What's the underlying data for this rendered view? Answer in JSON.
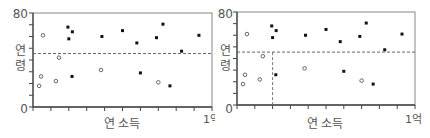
{
  "chart_data": [
    {
      "type": "scatter",
      "title": "",
      "xlabel": "연 소득",
      "ylabel": "연령",
      "x_tick_labels": {
        "start": "0",
        "end": "1억"
      },
      "y_tick_labels": {
        "top": "80",
        "bottom": "0"
      },
      "xlim": [
        0,
        100
      ],
      "ylim": [
        0,
        80
      ],
      "grid": false,
      "reference_lines": [
        {
          "orientation": "horizontal",
          "value": 45.5,
          "style": "dashed"
        }
      ],
      "series": [
        {
          "name": "open",
          "marker": "open-circle",
          "points": [
            [
              5.6,
              61
            ],
            [
              4.5,
              26
            ],
            [
              3.4,
              18
            ],
            [
              14.5,
              42
            ],
            [
              12.8,
              22
            ],
            [
              38,
              31.5
            ],
            [
              70,
              21
            ]
          ]
        },
        {
          "name": "filled",
          "marker": "filled-square",
          "points": [
            [
              20,
              58
            ],
            [
              19.5,
              68
            ],
            [
              22,
              64
            ],
            [
              21.8,
              26
            ],
            [
              38.5,
              60
            ],
            [
              50,
              65
            ],
            [
              58,
              54.5
            ],
            [
              60,
              29
            ],
            [
              69,
              59
            ],
            [
              72.6,
              70.5
            ],
            [
              76.5,
              18
            ],
            [
              83,
              47.5
            ],
            [
              92.7,
              61
            ]
          ]
        }
      ]
    },
    {
      "type": "scatter",
      "title": "",
      "xlabel": "연 소득",
      "ylabel": "연령",
      "x_tick_labels": {
        "start": "0",
        "end": "1억"
      },
      "y_tick_labels": {
        "top": "80",
        "bottom": "0"
      },
      "xlim": [
        0,
        100
      ],
      "ylim": [
        0,
        80
      ],
      "grid": false,
      "reference_lines": [
        {
          "orientation": "horizontal",
          "value": 45.5,
          "style": "dashed"
        },
        {
          "orientation": "vertical",
          "value": 20,
          "style": "dashed",
          "from": 0,
          "to": 45.5
        }
      ],
      "series": [
        {
          "name": "open",
          "marker": "open-circle",
          "points": [
            [
              5.6,
              61
            ],
            [
              4.5,
              26
            ],
            [
              3.4,
              18
            ],
            [
              14.5,
              42
            ],
            [
              12.8,
              22
            ],
            [
              38,
              31.5
            ],
            [
              70,
              21
            ]
          ]
        },
        {
          "name": "filled",
          "marker": "filled-square",
          "points": [
            [
              20,
              58
            ],
            [
              19.5,
              68
            ],
            [
              22,
              64
            ],
            [
              21.8,
              26
            ],
            [
              38.5,
              60
            ],
            [
              50,
              65
            ],
            [
              58,
              54.5
            ],
            [
              60,
              29
            ],
            [
              69,
              59
            ],
            [
              72.6,
              70.5
            ],
            [
              76.5,
              18
            ],
            [
              83,
              47.5
            ],
            [
              92.7,
              61
            ]
          ]
        }
      ]
    }
  ],
  "charts": [
    {
      "ylabel_top": "연",
      "ylabel_bottom": "령",
      "xlabel": "연 소득",
      "y_top": "80",
      "y_bottom": "0",
      "x_end": "1억"
    },
    {
      "ylabel_top": "연",
      "ylabel_bottom": "령",
      "xlabel": "연 소득",
      "y_top": "80",
      "y_bottom": "0",
      "x_end": "1억"
    }
  ]
}
